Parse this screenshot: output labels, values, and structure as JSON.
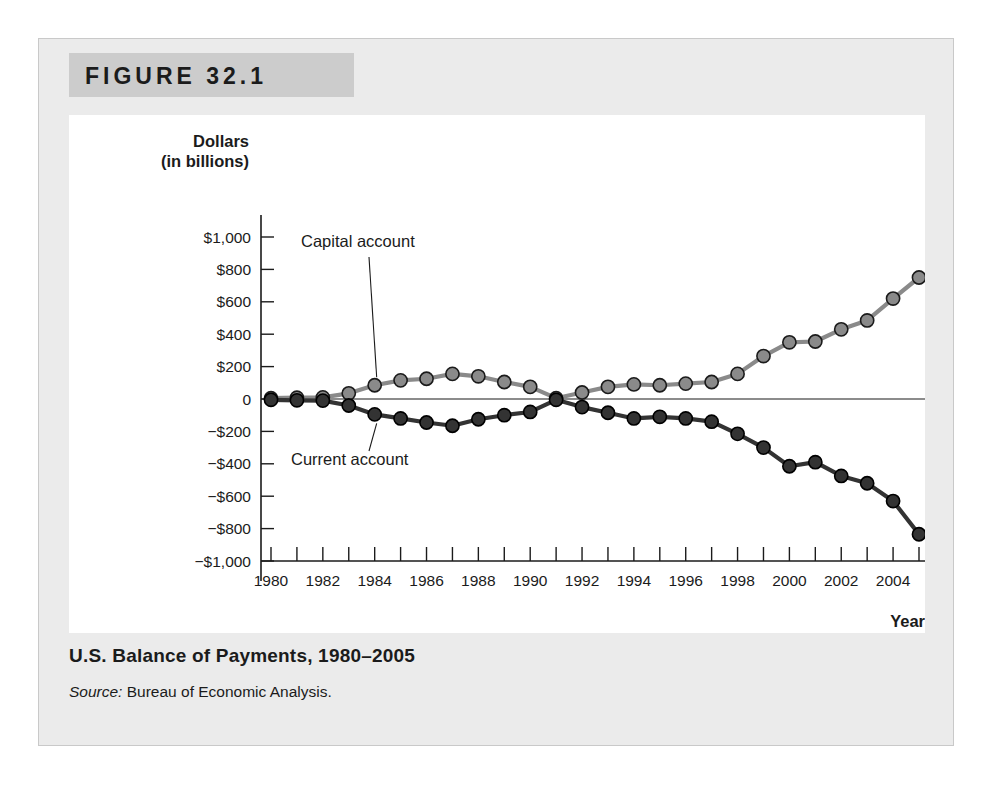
{
  "figure": {
    "banner_label": "FIGURE 32.1",
    "caption_title": "U.S. Balance of Payments, 1980–2005",
    "source_word": "Source:",
    "source_text": " Bureau of Economic Analysis."
  },
  "chart_data": {
    "type": "line",
    "title": "U.S. Balance of Payments, 1980–2005",
    "xlabel": "Year",
    "ylabel": "Dollars (in billions)",
    "ylabel_line1": "Dollars",
    "ylabel_line2": "(in billions)",
    "ylim": [
      -1000,
      1000
    ],
    "xlim": [
      1980,
      2005
    ],
    "grid": false,
    "legend_position": "inline-annotation",
    "ytick_values": [
      1000,
      800,
      600,
      400,
      200,
      0,
      -200,
      -400,
      -600,
      -800,
      -1000
    ],
    "ytick_labels": [
      "$1,000",
      "$800",
      "$600",
      "$400",
      "$200",
      "0",
      "−$200",
      "−$400",
      "−$600",
      "−$800",
      "−$1,000"
    ],
    "xtick_values": [
      1980,
      1981,
      1982,
      1983,
      1984,
      1985,
      1986,
      1987,
      1988,
      1989,
      1990,
      1991,
      1992,
      1993,
      1994,
      1995,
      1996,
      1997,
      1998,
      1999,
      2000,
      2001,
      2002,
      2003,
      2004,
      2005
    ],
    "xtick_labels_shown": [
      "1980",
      "1982",
      "1984",
      "1986",
      "1988",
      "1990",
      "1992",
      "1994",
      "1996",
      "1998",
      "2000",
      "2002",
      "2004"
    ],
    "x": [
      1980,
      1981,
      1982,
      1983,
      1984,
      1985,
      1986,
      1987,
      1988,
      1989,
      1990,
      1991,
      1992,
      1993,
      1994,
      1995,
      1996,
      1997,
      1998,
      1999,
      2000,
      2001,
      2002,
      2003,
      2004,
      2005
    ],
    "series": [
      {
        "name": "Capital account",
        "color": "#8a8a8a",
        "marker_color": "#8a8a8a",
        "marker_edge": "#1b1b1b",
        "values": [
          5,
          8,
          10,
          35,
          85,
          115,
          125,
          155,
          140,
          105,
          75,
          5,
          40,
          75,
          90,
          85,
          95,
          105,
          155,
          265,
          350,
          355,
          430,
          485,
          620,
          750
        ]
      },
      {
        "name": "Current account",
        "color": "#333333",
        "marker_color": "#333333",
        "marker_edge": "#000000",
        "values": [
          -5,
          -8,
          -10,
          -40,
          -95,
          -120,
          -145,
          -165,
          -125,
          -100,
          -80,
          -5,
          -50,
          -85,
          -120,
          -110,
          -120,
          -140,
          -215,
          -300,
          -415,
          -390,
          -475,
          -520,
          -630,
          -835
        ]
      }
    ],
    "annotations": [
      {
        "text": "Capital account",
        "series": "Capital account"
      },
      {
        "text": "Current account",
        "series": "Current account"
      }
    ]
  }
}
